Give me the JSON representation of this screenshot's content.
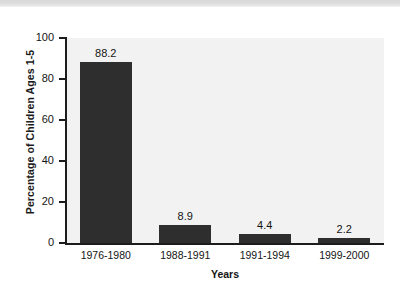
{
  "chart_data": {
    "type": "bar",
    "title": "",
    "xlabel": "Years",
    "ylabel": "Percentage of Children Ages 1-5",
    "categories": [
      "1976-1980",
      "1988-1991",
      "1991-1994",
      "1999-2000"
    ],
    "values": [
      88.2,
      8.9,
      4.4,
      2.2
    ],
    "value_labels": [
      "88.2",
      "8.9",
      "4.4",
      "2.2"
    ],
    "ylim": [
      0,
      100
    ],
    "yticks": [
      0,
      20,
      40,
      60,
      80,
      100
    ],
    "ytick_labels": [
      "0",
      "20",
      "40",
      "60",
      "80",
      "100"
    ],
    "grid": false,
    "legend": false,
    "bar_color": "#2e2e2e",
    "plot_background": "#f2f2f2",
    "axis_color": "#1c1c1c"
  }
}
